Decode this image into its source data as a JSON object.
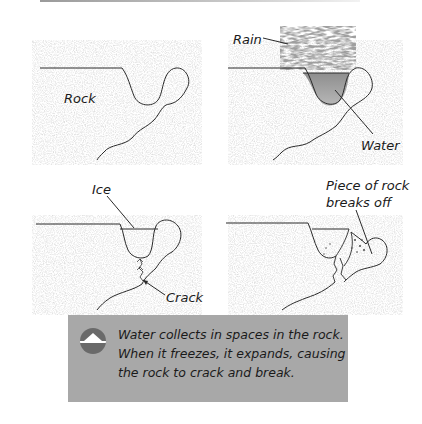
{
  "panels": [
    {
      "id": "panel-1",
      "labels": [
        {
          "text": "Rock"
        }
      ]
    },
    {
      "id": "panel-2",
      "labels": [
        {
          "text": "Rain"
        },
        {
          "text": "Water"
        }
      ]
    },
    {
      "id": "panel-3",
      "labels": [
        {
          "text": "Ice"
        },
        {
          "text": "Crack"
        }
      ]
    },
    {
      "id": "panel-4",
      "labels": [
        {
          "text": "Piece of rock"
        },
        {
          "text": "breaks off"
        }
      ]
    }
  ],
  "caption": {
    "icon": "triangle-up-circle-icon",
    "lines": [
      "Water collects in spaces in the rock.",
      "When it freezes, it expands, causing",
      "the rock to crack and break."
    ]
  },
  "colors": {
    "caption_bg": "#a8a8a8",
    "icon_bg": "#6a6a6a",
    "rock_texture": "#d6d6d6",
    "water": "#9c9c9c",
    "outline": "#2a2a2a"
  }
}
